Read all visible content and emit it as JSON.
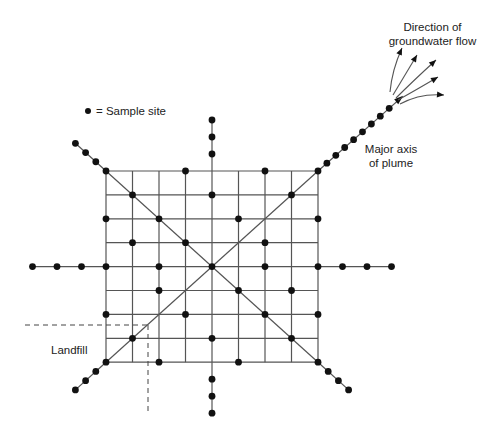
{
  "diagram": {
    "legend": {
      "symbol": "dot",
      "label": "= Sample site"
    },
    "labels": {
      "plume_axis": [
        "Major axis",
        "of plume"
      ],
      "flow_direction": [
        "Direction of",
        "groundwater flow"
      ],
      "landfill": "Landfill"
    },
    "grid": {
      "columns": 9,
      "rows": 9,
      "sample_points": [
        [
          0,
          0
        ],
        [
          3,
          0
        ],
        [
          6,
          0
        ],
        [
          8,
          0
        ],
        [
          1,
          1
        ],
        [
          4,
          1
        ],
        [
          7,
          1
        ],
        [
          0,
          2
        ],
        [
          2,
          2
        ],
        [
          5,
          2
        ],
        [
          8,
          2
        ],
        [
          1,
          3
        ],
        [
          3,
          3
        ],
        [
          6,
          3
        ],
        [
          0,
          4
        ],
        [
          2,
          4
        ],
        [
          4,
          4
        ],
        [
          6,
          4
        ],
        [
          8,
          4
        ],
        [
          2,
          5
        ],
        [
          5,
          5
        ],
        [
          7,
          5
        ],
        [
          0,
          6
        ],
        [
          3,
          6
        ],
        [
          6,
          6
        ],
        [
          8,
          6
        ],
        [
          1,
          7
        ],
        [
          4,
          7
        ],
        [
          7,
          7
        ],
        [
          0,
          8
        ],
        [
          2,
          8
        ],
        [
          5,
          8
        ],
        [
          8,
          8
        ]
      ]
    },
    "transects": {
      "north": 3,
      "south": 3,
      "west": 3,
      "east": 3,
      "northwest": 3,
      "southwest": 3,
      "southeast": 3,
      "northeast": 8
    },
    "flow_arrows": 5,
    "colors": {
      "ink": "#111111",
      "line": "#555555",
      "background": "#ffffff"
    }
  }
}
